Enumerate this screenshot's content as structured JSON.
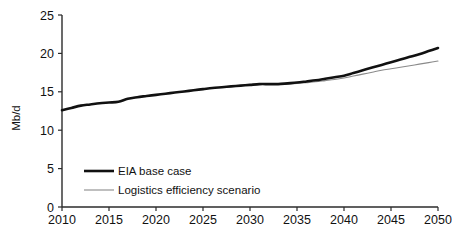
{
  "chart_data": {
    "type": "line",
    "title": "",
    "subtitle": "",
    "xlabel": "",
    "ylabel": "Mb/d",
    "xlim": [
      2010,
      2050
    ],
    "ylim": [
      0,
      25
    ],
    "grid": false,
    "legend_position": "inside-lower-left",
    "x_ticks": [
      2010,
      2015,
      2020,
      2025,
      2030,
      2035,
      2040,
      2045,
      2050
    ],
    "y_ticks": [
      0,
      5,
      10,
      15,
      20,
      25
    ],
    "x": [
      2010,
      2011,
      2012,
      2013,
      2014,
      2015,
      2016,
      2017,
      2018,
      2019,
      2020,
      2021,
      2022,
      2023,
      2024,
      2025,
      2026,
      2027,
      2028,
      2029,
      2030,
      2031,
      2032,
      2033,
      2034,
      2035,
      2036,
      2037,
      2038,
      2039,
      2040,
      2041,
      2042,
      2043,
      2044,
      2045,
      2046,
      2047,
      2048,
      2049,
      2050
    ],
    "series": [
      {
        "name": "EIA base case",
        "color": "#111111",
        "width": "thick",
        "values": [
          12.6,
          12.9,
          13.2,
          13.35,
          13.5,
          13.6,
          13.7,
          14.1,
          14.3,
          14.45,
          14.6,
          14.75,
          14.9,
          15.05,
          15.2,
          15.35,
          15.5,
          15.6,
          15.7,
          15.8,
          15.9,
          16.0,
          16.0,
          16.0,
          16.1,
          16.2,
          16.35,
          16.5,
          16.7,
          16.9,
          17.1,
          17.45,
          17.8,
          18.15,
          18.5,
          18.85,
          19.2,
          19.55,
          19.9,
          20.3,
          20.7
        ]
      },
      {
        "name": "Logistics efficiency scenario",
        "color": "#8a8a8a",
        "width": "thin",
        "values": [
          12.6,
          12.9,
          13.2,
          13.35,
          13.5,
          13.6,
          13.7,
          14.1,
          14.3,
          14.45,
          14.6,
          14.75,
          14.9,
          15.05,
          15.2,
          15.35,
          15.5,
          15.6,
          15.7,
          15.8,
          15.9,
          15.95,
          15.95,
          15.95,
          16.0,
          16.1,
          16.2,
          16.3,
          16.45,
          16.6,
          16.8,
          17.05,
          17.3,
          17.55,
          17.8,
          18.0,
          18.2,
          18.4,
          18.6,
          18.8,
          19.0
        ]
      }
    ]
  },
  "legend": {
    "items": [
      {
        "label": "EIA base case",
        "color": "#111111"
      },
      {
        "label": "Logistics efficiency scenario",
        "color": "#8a8a8a"
      }
    ]
  },
  "axes": {
    "y_title": "Mb/d",
    "y_tick_labels": [
      "25",
      "20",
      "15",
      "10",
      "5",
      "0"
    ],
    "x_tick_labels": [
      "2010",
      "2015",
      "2020",
      "2025",
      "2030",
      "2035",
      "2040",
      "2045",
      "2050"
    ]
  },
  "colors": {
    "base_case": "#111111",
    "logistics": "#8a8a8a",
    "axis": "#2b2b2b",
    "background": "#ffffff"
  }
}
